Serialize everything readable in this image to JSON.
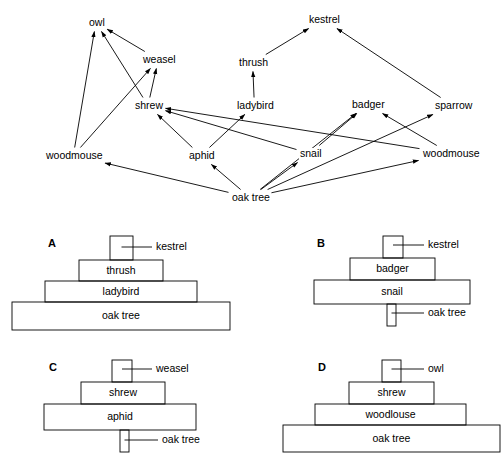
{
  "figure": {
    "background_color": "#ffffff",
    "line_color": "#000000"
  },
  "food_web": {
    "nodes": [
      {
        "id": "owl",
        "label": "owl",
        "x": 88,
        "y": 17
      },
      {
        "id": "kestrel",
        "label": "kestrel",
        "x": 308,
        "y": 14
      },
      {
        "id": "weasel",
        "label": "weasel",
        "x": 142,
        "y": 54
      },
      {
        "id": "thrush",
        "label": "thrush",
        "x": 238,
        "y": 57
      },
      {
        "id": "shrew",
        "label": "shrew",
        "x": 134,
        "y": 100
      },
      {
        "id": "ladybird",
        "label": "ladybird",
        "x": 236,
        "y": 100
      },
      {
        "id": "badger",
        "label": "badger",
        "x": 351,
        "y": 99
      },
      {
        "id": "sparrow",
        "label": "sparrow",
        "x": 434,
        "y": 100
      },
      {
        "id": "woodmouse_l",
        "label": "woodmouse",
        "x": 45,
        "y": 150
      },
      {
        "id": "aphid",
        "label": "aphid",
        "x": 188,
        "y": 150
      },
      {
        "id": "snail",
        "label": "snail",
        "x": 299,
        "y": 148
      },
      {
        "id": "woodmouse_r",
        "label": "woodmouse",
        "x": 422,
        "y": 148
      },
      {
        "id": "oak_tree",
        "label": "oak tree",
        "x": 231,
        "y": 192
      }
    ],
    "links": [
      {
        "from": "woodmouse_l",
        "to": "owl"
      },
      {
        "from": "shrew",
        "to": "owl"
      },
      {
        "from": "weasel",
        "to": "owl"
      },
      {
        "from": "shrew",
        "to": "weasel"
      },
      {
        "from": "woodmouse_l",
        "to": "weasel"
      },
      {
        "from": "ladybird",
        "to": "thrush"
      },
      {
        "from": "thrush",
        "to": "kestrel"
      },
      {
        "from": "sparrow",
        "to": "kestrel"
      },
      {
        "from": "aphid",
        "to": "shrew"
      },
      {
        "from": "snail",
        "to": "shrew"
      },
      {
        "from": "woodmouse_r",
        "to": "shrew"
      },
      {
        "from": "aphid",
        "to": "ladybird"
      },
      {
        "from": "snail",
        "to": "badger"
      },
      {
        "from": "woodmouse_r",
        "to": "badger"
      },
      {
        "from": "oak_tree",
        "to": "badger"
      },
      {
        "from": "oak_tree",
        "to": "sparrow"
      },
      {
        "from": "oak_tree",
        "to": "aphid"
      },
      {
        "from": "oak_tree",
        "to": "snail"
      },
      {
        "from": "oak_tree",
        "to": "woodmouse_l"
      },
      {
        "from": "oak_tree",
        "to": "woodmouse_r"
      }
    ]
  },
  "pyramids": [
    {
      "letter": "A",
      "letter_x": 48,
      "letter_y": 238,
      "levels": [
        {
          "label": "kestrel",
          "inside": false,
          "x": 110,
          "y": 236,
          "w": 23,
          "h": 24,
          "leader_to_x": 152,
          "leader_y": 247
        },
        {
          "label": "thrush",
          "inside": true,
          "x": 79,
          "y": 260,
          "w": 84,
          "h": 21
        },
        {
          "label": "ladybird",
          "inside": true,
          "x": 45,
          "y": 281,
          "w": 152,
          "h": 21
        },
        {
          "label": "oak tree",
          "inside": true,
          "x": 12,
          "y": 302,
          "w": 218,
          "h": 28
        }
      ]
    },
    {
      "letter": "B",
      "letter_x": 317,
      "letter_y": 238,
      "levels": [
        {
          "label": "kestrel",
          "inside": false,
          "x": 383,
          "y": 236,
          "w": 20,
          "h": 22,
          "leader_to_x": 424,
          "leader_y": 245
        },
        {
          "label": "badger",
          "inside": true,
          "x": 350,
          "y": 258,
          "w": 85,
          "h": 22
        },
        {
          "label": "snail",
          "inside": true,
          "x": 314,
          "y": 280,
          "w": 156,
          "h": 24
        },
        {
          "label": "oak tree",
          "inside": false,
          "x": 387,
          "y": 304,
          "w": 9,
          "h": 22,
          "leader_to_x": 424,
          "leader_y": 313
        }
      ]
    },
    {
      "letter": "C",
      "letter_x": 49,
      "letter_y": 362,
      "levels": [
        {
          "label": "weasel",
          "inside": false,
          "x": 112,
          "y": 360,
          "w": 20,
          "h": 22,
          "leader_to_x": 152,
          "leader_y": 369
        },
        {
          "label": "shrew",
          "inside": true,
          "x": 81,
          "y": 382,
          "w": 84,
          "h": 22
        },
        {
          "label": "aphid",
          "inside": true,
          "x": 44,
          "y": 404,
          "w": 152,
          "h": 26
        },
        {
          "label": "oak tree",
          "inside": false,
          "x": 120,
          "y": 430,
          "w": 9,
          "h": 22,
          "leader_to_x": 158,
          "leader_y": 440
        }
      ]
    },
    {
      "letter": "D",
      "letter_x": 318,
      "letter_y": 362,
      "levels": [
        {
          "label": "owl",
          "inside": false,
          "x": 382,
          "y": 360,
          "w": 19,
          "h": 22,
          "leader_to_x": 424,
          "leader_y": 369
        },
        {
          "label": "shrew",
          "inside": true,
          "x": 349,
          "y": 382,
          "w": 85,
          "h": 22
        },
        {
          "label": "woodlouse",
          "inside": true,
          "x": 315,
          "y": 404,
          "w": 151,
          "h": 21
        },
        {
          "label": "oak tree",
          "inside": true,
          "x": 283,
          "y": 425,
          "w": 217,
          "h": 27
        }
      ]
    }
  ]
}
